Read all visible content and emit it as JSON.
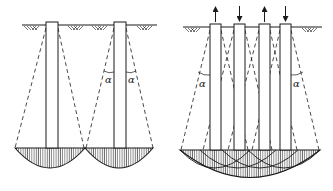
{
  "diagram": {
    "colors": {
      "line": "#1a1a1a",
      "hatch": "#333333",
      "background": "#ffffff"
    },
    "left_panel": {
      "name": "widely-spaced-piles",
      "pile_count": 2,
      "angle_labels": [
        "α",
        "α"
      ]
    },
    "right_panel": {
      "name": "pile-group",
      "pile_count": 4,
      "load_arrows": [
        "up",
        "down",
        "up",
        "down"
      ],
      "angle_labels": [
        "α",
        "α"
      ]
    }
  }
}
